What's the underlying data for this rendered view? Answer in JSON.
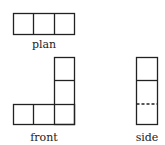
{
  "views": {
    "plan": {
      "label": "plan"
    },
    "front": {
      "label": "front"
    },
    "side": {
      "label": "side"
    }
  },
  "colors": {
    "stroke": "#222222",
    "background": "#ffffff"
  }
}
